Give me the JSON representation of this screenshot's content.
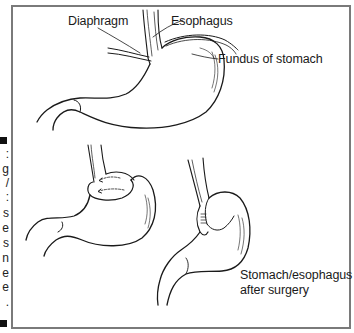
{
  "figure": {
    "caption_fragment": {
      "chars": [
        ":",
        "g",
        "/",
        ":",
        "s",
        "e",
        "s",
        "n",
        "e",
        "e",
        "."
      ],
      "has_start_marker": true,
      "has_end_marker": true
    },
    "labels": {
      "diaphragm": "Diaphragm",
      "esophagus": "Esophagus",
      "fundus": "Fundus of stomach",
      "after_surgery_line1": "Stomach/esophagus",
      "after_surgery_line2": "after surgery"
    },
    "panels": [
      {
        "name": "normal-stomach",
        "description": "Stomach with esophagus passing through diaphragm, fundus labeled"
      },
      {
        "name": "fundus-wrap",
        "description": "Fundus being wrapped around lower esophagus, arrows showing direction"
      },
      {
        "name": "after-surgery",
        "description": "Stomach/esophagus after surgery with sutured wrap"
      }
    ],
    "colors": {
      "line": "#1a1a1a",
      "frame": "#7a7a7a",
      "background": "#ffffff"
    }
  }
}
